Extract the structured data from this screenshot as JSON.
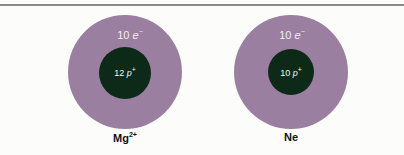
{
  "topline_color": "#8a8a8a",
  "atoms": [
    {
      "label": "Mg",
      "charge": "2+",
      "electrons": "10",
      "e_symbol": "e",
      "e_sup": "−",
      "protons": "12",
      "p_symbol": "p",
      "p_sup": "+"
    },
    {
      "label": "Ne",
      "charge": "",
      "electrons": "10",
      "e_symbol": "e",
      "e_sup": "−",
      "protons": "10",
      "p_symbol": "p",
      "p_sup": "+"
    }
  ],
  "colors": {
    "electron_cloud": "#9b7fa0",
    "nucleus": "#0d2a19"
  }
}
